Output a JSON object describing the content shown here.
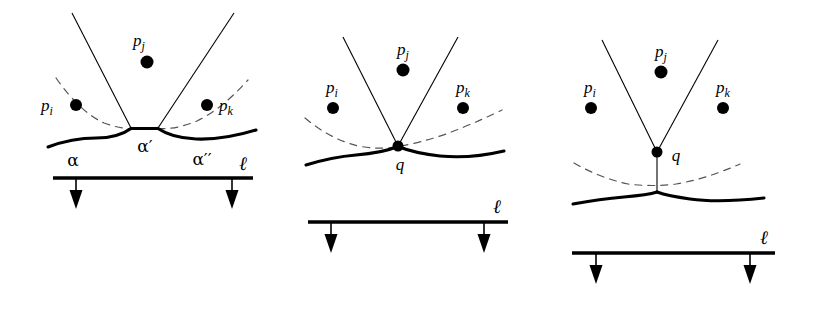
{
  "figure": {
    "type": "diagram",
    "background_color": "#ffffff",
    "stroke_color": "#000000",
    "dashed_color": "#555555",
    "panels": [
      {
        "id": "panel-left",
        "labels": {
          "p_i": "p",
          "p_i_sub": "i",
          "p_j": "p",
          "p_j_sub": "j",
          "p_k": "p",
          "p_k_sub": "k",
          "arc_alpha": "α",
          "arc_alpha_prime": "α′",
          "arc_alpha_double_prime": "α′′",
          "sweepline": "ℓ"
        },
        "sites": [
          {
            "name": "p_i",
            "x": 76,
            "y": 105
          },
          {
            "name": "p_j",
            "x": 147,
            "y": 62
          },
          {
            "name": "p_k",
            "x": 207,
            "y": 105
          }
        ],
        "sweepline_y": 178,
        "sweepline_x1": 53,
        "sweepline_x2": 253,
        "arrow_x": [
          76,
          232
        ],
        "breakpoints": [
          [
            131,
            128
          ],
          [
            158,
            128
          ]
        ]
      },
      {
        "id": "panel-middle",
        "labels": {
          "p_i": "p",
          "p_i_sub": "i",
          "p_j": "p",
          "p_j_sub": "j",
          "p_k": "p",
          "p_k_sub": "k",
          "event_point": "q",
          "sweepline": "ℓ"
        },
        "sites": [
          {
            "name": "p_i",
            "x": 333,
            "y": 108
          },
          {
            "name": "p_j",
            "x": 403,
            "y": 70
          },
          {
            "name": "p_k",
            "x": 463,
            "y": 108
          }
        ],
        "sweepline_y": 222,
        "sweepline_x1": 308,
        "sweepline_x2": 508,
        "arrow_x": [
          331,
          484
        ],
        "q": {
          "x": 398,
          "y": 146
        }
      },
      {
        "id": "panel-right",
        "labels": {
          "p_i": "p",
          "p_i_sub": "i",
          "p_j": "p",
          "p_j_sub": "j",
          "p_k": "p",
          "p_k_sub": "k",
          "event_point": "q",
          "sweepline": "ℓ"
        },
        "sites": [
          {
            "name": "p_i",
            "x": 591,
            "y": 108
          },
          {
            "name": "p_j",
            "x": 661,
            "y": 72
          },
          {
            "name": "p_k",
            "x": 723,
            "y": 108
          }
        ],
        "sweepline_y": 253,
        "sweepline_x1": 572,
        "sweepline_x2": 775,
        "arrow_x": [
          596,
          750
        ],
        "q": {
          "x": 657,
          "y": 152
        },
        "cusp": {
          "x": 657,
          "y": 192
        }
      }
    ]
  }
}
